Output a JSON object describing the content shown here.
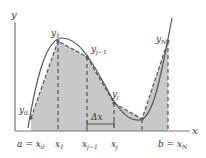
{
  "diagram": {
    "axes": {
      "x_label": "x",
      "y_label": "y"
    },
    "point_labels": [
      "y0",
      "y1",
      "yj-1",
      "yj",
      "yN"
    ],
    "x_tick_labels": [
      "a = x0",
      "x1",
      "xj-1",
      "xj",
      "b = xN"
    ],
    "interval_label": "Δx",
    "colors": {
      "fill": "#c8c8c8",
      "curve": "#555555",
      "axis": "#777777",
      "dash": "#555555"
    }
  }
}
